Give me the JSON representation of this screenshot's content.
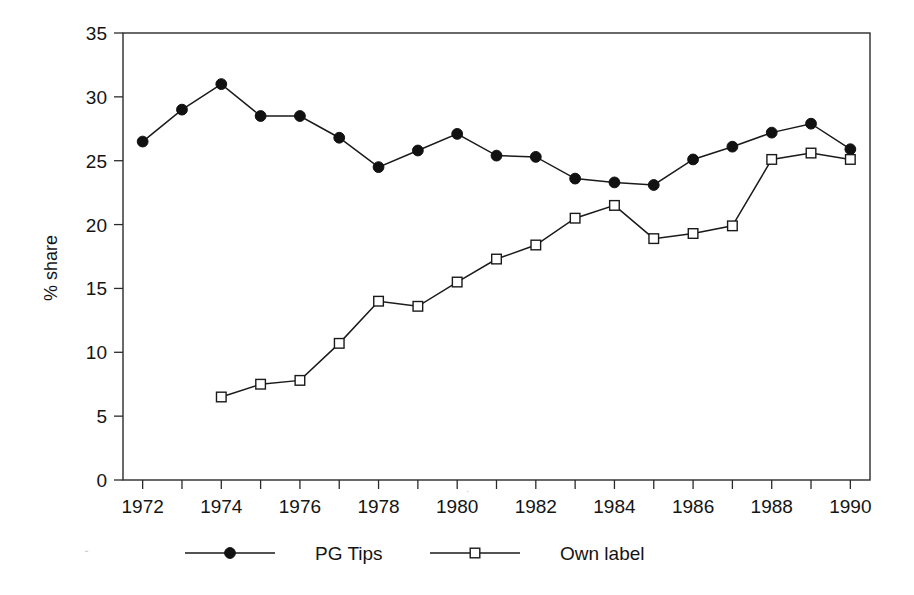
{
  "chart_data": {
    "type": "line",
    "title": "",
    "subtitle": "",
    "xlabel": "",
    "ylabel": "% share",
    "x": [
      1972,
      1973,
      1974,
      1975,
      1976,
      1977,
      1978,
      1979,
      1980,
      1981,
      1982,
      1983,
      1984,
      1985,
      1986,
      1987,
      1988,
      1989,
      1990
    ],
    "xlim": [
      1971.5,
      1990.5
    ],
    "ylim": [
      0,
      35
    ],
    "y_ticks": [
      0,
      5,
      10,
      15,
      20,
      25,
      30,
      35
    ],
    "y_tick_labels": [
      "0",
      "5",
      "10",
      "15",
      "20",
      "25",
      "30",
      "35"
    ],
    "x_ticks": [
      1972,
      1973,
      1974,
      1975,
      1976,
      1977,
      1978,
      1979,
      1980,
      1981,
      1982,
      1983,
      1984,
      1985,
      1986,
      1987,
      1988,
      1989,
      1990
    ],
    "x_tick_labels": [
      "1972",
      "",
      "1974",
      "",
      "1976",
      "",
      "1978",
      "",
      "1980",
      "",
      "1982",
      "",
      "1984",
      "",
      "1986",
      "",
      "1988",
      "",
      "1990"
    ],
    "x_labelled_ticks": [
      "1972",
      "1974",
      "1976",
      "1978",
      "1980",
      "1982",
      "1984",
      "1986",
      "1988",
      "1990"
    ],
    "grid": false,
    "legend_position": "below",
    "series": [
      {
        "name": "PG Tips",
        "marker": "filled-circle",
        "color": "#111111",
        "x": [
          1972,
          1973,
          1974,
          1975,
          1976,
          1977,
          1978,
          1979,
          1980,
          1981,
          1982,
          1983,
          1984,
          1985,
          1986,
          1987,
          1988,
          1989,
          1990
        ],
        "values": [
          26.5,
          29.0,
          31.0,
          28.5,
          28.5,
          26.8,
          24.5,
          25.8,
          27.1,
          25.4,
          25.3,
          23.6,
          23.3,
          23.1,
          25.1,
          26.1,
          27.2,
          27.9,
          25.9
        ]
      },
      {
        "name": "Own label",
        "marker": "open-square",
        "color": "#1a1a1a",
        "x": [
          1974,
          1975,
          1976,
          1977,
          1978,
          1979,
          1980,
          1981,
          1982,
          1983,
          1984,
          1985,
          1986,
          1987,
          1988,
          1989,
          1990
        ],
        "values": [
          6.5,
          7.5,
          7.8,
          10.7,
          14.0,
          13.6,
          15.5,
          17.3,
          18.4,
          20.5,
          21.5,
          18.9,
          19.3,
          19.9,
          25.1,
          25.6,
          25.1
        ]
      }
    ]
  },
  "legend": {
    "entries": [
      {
        "label": "PG Tips",
        "marker": "filled-circle"
      },
      {
        "label": "Own label",
        "marker": "open-square"
      }
    ]
  },
  "axes": {
    "y_title": "% share"
  }
}
